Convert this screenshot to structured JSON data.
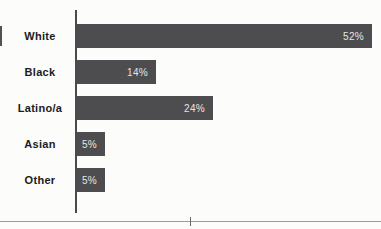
{
  "chart_data": {
    "type": "bar",
    "orientation": "horizontal",
    "title": "",
    "xlabel": "",
    "ylabel": "",
    "categories": [
      "White",
      "Black",
      "Latino/a",
      "Asian",
      "Other"
    ],
    "values": [
      52,
      14,
      24,
      5,
      5
    ],
    "value_labels": [
      "52%",
      "14%",
      "24%",
      "5%",
      "5%"
    ],
    "xlim": [
      0,
      52
    ],
    "grid": false,
    "legend": false,
    "value_label_position": "inside-end",
    "colors": {
      "bar": "#4d4d4f",
      "category_label": "#1c1b1a",
      "value_label": "#e7e5e1",
      "axis_line": "#4a4a4c",
      "background": "#fcfcfa"
    }
  },
  "footer": {
    "rule_color": "#9b9b99",
    "tick_color": "#6b6b69"
  }
}
